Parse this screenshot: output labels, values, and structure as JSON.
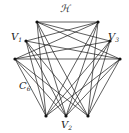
{
  "diagram": {
    "type": "graph",
    "labels": {
      "top": "ℋ",
      "v1": {
        "main": "V",
        "sub": "1"
      },
      "v3": {
        "main": "V",
        "sub": "3"
      },
      "c6": {
        "main": "C",
        "sub": "6"
      },
      "v2": {
        "main": "V",
        "sub": "2"
      }
    },
    "vertices": [
      {
        "id": "T1",
        "x": 37,
        "y": 22
      },
      {
        "id": "T2",
        "x": 98,
        "y": 22
      },
      {
        "id": "L1",
        "x": 26,
        "y": 41
      },
      {
        "id": "R1",
        "x": 110,
        "y": 41
      },
      {
        "id": "O1",
        "x": 15,
        "y": 59
      },
      {
        "id": "O2",
        "x": 120,
        "y": 59
      },
      {
        "id": "B1",
        "x": 46,
        "y": 116
      },
      {
        "id": "B2",
        "x": 66,
        "y": 116
      },
      {
        "id": "B3",
        "x": 88,
        "y": 116
      }
    ],
    "edges": [
      [
        "T1",
        "T2"
      ],
      [
        "O1",
        "O2"
      ],
      [
        "T1",
        "R1"
      ],
      [
        "T1",
        "O2"
      ],
      [
        "T2",
        "L1"
      ],
      [
        "T2",
        "O1"
      ],
      [
        "L1",
        "O2"
      ],
      [
        "R1",
        "O1"
      ],
      [
        "B1",
        "T1"
      ],
      [
        "B1",
        "T2"
      ],
      [
        "B1",
        "L1"
      ],
      [
        "B1",
        "R1"
      ],
      [
        "B1",
        "O1"
      ],
      [
        "B1",
        "O2"
      ],
      [
        "B2",
        "T1"
      ],
      [
        "B2",
        "T2"
      ],
      [
        "B2",
        "L1"
      ],
      [
        "B2",
        "R1"
      ],
      [
        "B2",
        "O1"
      ],
      [
        "B2",
        "O2"
      ],
      [
        "B3",
        "T1"
      ],
      [
        "B3",
        "T2"
      ],
      [
        "B3",
        "L1"
      ],
      [
        "B3",
        "R1"
      ],
      [
        "B3",
        "O1"
      ],
      [
        "B3",
        "O2"
      ]
    ],
    "colors": {
      "edge": "#1a1a1a",
      "vertex": "#111111",
      "background": "#ffffff"
    }
  }
}
